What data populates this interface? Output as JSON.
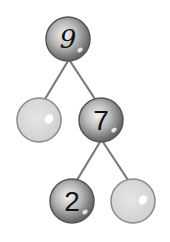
{
  "diagram": {
    "type": "number-bond-tree",
    "nodes": [
      {
        "id": "root",
        "label": "9",
        "filled": true,
        "cx": 68,
        "cy": 39
      },
      {
        "id": "left-1",
        "label": "",
        "filled": false,
        "cx": 39,
        "cy": 120
      },
      {
        "id": "right-1",
        "label": "7",
        "filled": true,
        "cx": 101,
        "cy": 120
      },
      {
        "id": "left-2",
        "label": "2",
        "filled": true,
        "cx": 72,
        "cy": 201
      },
      {
        "id": "right-2",
        "label": "",
        "filled": false,
        "cx": 133,
        "cy": 201
      }
    ],
    "edges": [
      {
        "from": "root",
        "to": "left-1"
      },
      {
        "from": "root",
        "to": "right-1"
      },
      {
        "from": "right-1",
        "to": "left-2"
      },
      {
        "from": "right-1",
        "to": "right-2"
      }
    ],
    "colors": {
      "filled_ball": "#8a8a8a",
      "empty_ball": "#d8d8d8",
      "line": "#7a7a7a"
    }
  }
}
